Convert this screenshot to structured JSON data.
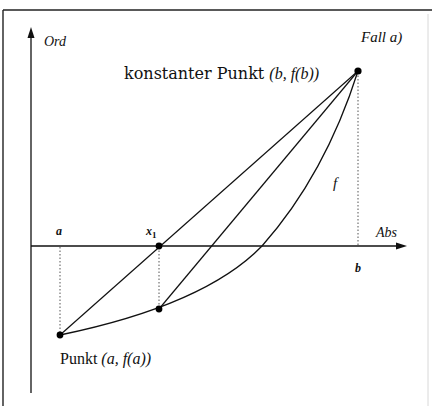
{
  "diagram": {
    "case_label": "Fall a)",
    "y_axis_label": "Ord",
    "x_axis_label": "Abs",
    "function_label": "f",
    "ticks": {
      "a": "a",
      "x1": "x",
      "x1_sub": "1",
      "b": "b"
    },
    "point_fixed": {
      "prefix": "konstanter Punkt ",
      "coords": "(b, f(b))"
    },
    "point_start": {
      "prefix": "Punkt ",
      "coords": "(a, f(a))"
    },
    "colors": {
      "ink": "#111111",
      "background": "#ffffff",
      "frame": "#222222"
    }
  }
}
